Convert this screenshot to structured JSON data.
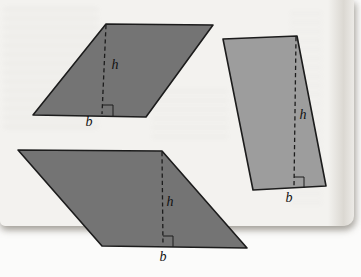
{
  "figure": {
    "kind": "geometry-diagram",
    "colors": {
      "page": "#f3f2ef",
      "backdrop": "#fbfbfa",
      "dark": "#747474",
      "light": "#9d9d9d",
      "outline": "#1c1c1c",
      "label": "#111111"
    },
    "parallelograms": [
      {
        "id": "top-left",
        "fill": "dark",
        "points": "106,24 213,25 146,117 33,115",
        "height_line": {
          "x1": 106,
          "y1": 25,
          "x2": 102,
          "y2": 114
        },
        "right_angle_points": "103,105 113,105 113,116",
        "height_label": "h",
        "base_label": "b",
        "height_label_pos": {
          "x": 115,
          "y": 69
        },
        "base_label_pos": {
          "x": 89,
          "y": 126
        }
      },
      {
        "id": "right",
        "fill": "light",
        "points": "223,39 297,36 326,186 253,190",
        "height_line": {
          "x1": 296,
          "y1": 37,
          "x2": 294,
          "y2": 187
        },
        "right_angle_points": "294,177 304,177 304,188",
        "height_label": "h",
        "base_label": "b",
        "height_label_pos": {
          "x": 303,
          "y": 119
        },
        "base_label_pos": {
          "x": 289,
          "y": 202
        }
      },
      {
        "id": "bottom",
        "fill": "dark",
        "points": "18,150 162,151 247,248 102,246",
        "height_line": {
          "x1": 162,
          "y1": 152,
          "x2": 163,
          "y2": 245
        },
        "right_angle_points": "163,236 173,236 173,247",
        "height_label": "h",
        "base_label": "b",
        "height_label_pos": {
          "x": 170,
          "y": 206
        },
        "base_label_pos": {
          "x": 163,
          "y": 261
        }
      }
    ]
  }
}
